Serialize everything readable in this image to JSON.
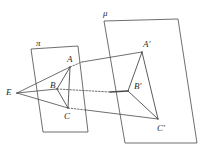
{
  "figure": {
    "background": "#ffffff",
    "stroke_color": "#4a4a4a",
    "label_color": "#2b2b2b",
    "width": 203,
    "height": 154
  },
  "planes": {
    "pi": {
      "label": "π",
      "label_x": 36,
      "label_y": 39,
      "corners": [
        [
          31,
          49
        ],
        [
          78,
          46
        ],
        [
          88,
          132
        ],
        [
          43,
          132
        ]
      ]
    },
    "mu": {
      "label": "μ",
      "label_x": 103,
      "label_y": 9,
      "corners": [
        [
          104,
          21
        ],
        [
          178,
          19
        ],
        [
          197,
          143
        ],
        [
          125,
          143
        ]
      ]
    }
  },
  "points": [
    {
      "id": "E",
      "label": "E",
      "x": 17,
      "y": 93,
      "label_x": 6,
      "label_y": 88
    },
    {
      "id": "A",
      "label": "A",
      "x": 70,
      "y": 67,
      "label_x": 67,
      "label_y": 55
    },
    {
      "id": "B",
      "label": "B",
      "x": 57,
      "y": 89,
      "label_x": 50,
      "label_y": 81
    },
    {
      "id": "C",
      "label": "C",
      "x": 68,
      "y": 108,
      "label_x": 64,
      "label_y": 112
    },
    {
      "id": "Ap",
      "label": "A′",
      "x": 142,
      "y": 52,
      "label_x": 143,
      "label_y": 40
    },
    {
      "id": "Bp",
      "label": "B′",
      "x": 128,
      "y": 91,
      "label_x": 134,
      "label_y": 82
    },
    {
      "id": "Cp",
      "label": "C′",
      "x": 158,
      "y": 119,
      "label_x": 157,
      "label_y": 124
    }
  ],
  "triangles": [
    {
      "name": "triangle-abc",
      "vertices": [
        "A",
        "B",
        "C"
      ],
      "style": "solid"
    },
    {
      "name": "triangle-a-prime-b-prime-c-prime",
      "vertices": [
        "Ap",
        "Bp",
        "Cp"
      ],
      "style": "solid"
    }
  ],
  "rays": [
    {
      "name": "ray-e-a-aprime",
      "from": "E",
      "through": "A",
      "to": "Ap",
      "solid_to_point": true,
      "dashed_after_point": true,
      "dash_end_x": 82,
      "dash_end_y": 62
    },
    {
      "name": "ray-e-b-bprime",
      "from": "E",
      "through": "B",
      "to": "Bp",
      "solid_to_point": true,
      "dashed_after_point": true,
      "dash_end_x": 110,
      "dash_end_y": 92
    },
    {
      "name": "ray-e-c-cprime",
      "from": "E",
      "through": "C",
      "to": "Cp",
      "solid_to_point": true,
      "dashed_after_point": true,
      "dash_end_x": 86,
      "dash_end_y": 110
    }
  ]
}
